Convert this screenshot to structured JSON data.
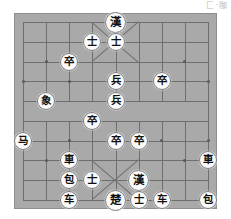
{
  "app": {
    "watermark": "匚·咖"
  },
  "board": {
    "name": "xiangqi-board",
    "columns": 9,
    "rows": 10,
    "board_color": "#a9a9a9",
    "line_color": "#6e6e6e",
    "border_color": "#8e8e8e",
    "piece_face_color": "#fbfbfb",
    "piece_text_color": "#111111",
    "star_points": [
      {
        "col": 1,
        "row": 2
      },
      {
        "col": 7,
        "row": 2
      },
      {
        "col": 0,
        "row": 3
      },
      {
        "col": 2,
        "row": 3
      },
      {
        "col": 4,
        "row": 3
      },
      {
        "col": 6,
        "row": 3
      },
      {
        "col": 8,
        "row": 3
      },
      {
        "col": 1,
        "row": 7
      },
      {
        "col": 7,
        "row": 7
      },
      {
        "col": 0,
        "row": 6
      },
      {
        "col": 2,
        "row": 6
      },
      {
        "col": 4,
        "row": 6
      },
      {
        "col": 6,
        "row": 6
      },
      {
        "col": 8,
        "row": 6
      }
    ],
    "pieces": [
      {
        "id": "p01",
        "glyph": "漢",
        "name": "general-han-top",
        "col": 4,
        "row": 0,
        "type": "general"
      },
      {
        "id": "p02",
        "glyph": "士",
        "name": "advisor",
        "col": 3,
        "row": 1,
        "type": "advisor"
      },
      {
        "id": "p03",
        "glyph": "士",
        "name": "advisor",
        "col": 4,
        "row": 1,
        "type": "advisor"
      },
      {
        "id": "p04",
        "glyph": "卒",
        "name": "pawn-zu",
        "col": 2,
        "row": 2,
        "type": "pawn"
      },
      {
        "id": "p05",
        "glyph": "兵",
        "name": "soldier-bing",
        "col": 4,
        "row": 3,
        "type": "soldier"
      },
      {
        "id": "p06",
        "glyph": "卒",
        "name": "pawn-zu",
        "col": 6,
        "row": 3,
        "type": "pawn"
      },
      {
        "id": "p07",
        "glyph": "象",
        "name": "elephant-xiang",
        "col": 1,
        "row": 4,
        "type": "elephant"
      },
      {
        "id": "p08",
        "glyph": "兵",
        "name": "soldier-bing",
        "col": 4,
        "row": 4,
        "type": "soldier"
      },
      {
        "id": "p09",
        "glyph": "卒",
        "name": "pawn-zu",
        "col": 3,
        "row": 5,
        "type": "pawn"
      },
      {
        "id": "p10",
        "glyph": "马",
        "name": "horse-ma",
        "col": 0,
        "row": 6,
        "type": "horse"
      },
      {
        "id": "p11",
        "glyph": "卒",
        "name": "pawn-zu",
        "col": 4,
        "row": 6,
        "type": "pawn"
      },
      {
        "id": "p12",
        "glyph": "卒",
        "name": "pawn-zu",
        "col": 5,
        "row": 6,
        "type": "pawn"
      },
      {
        "id": "p13",
        "glyph": "車",
        "name": "chariot-ju",
        "col": 2,
        "row": 7,
        "type": "chariot"
      },
      {
        "id": "p14",
        "glyph": "車",
        "name": "chariot-ju",
        "col": 8,
        "row": 7,
        "type": "chariot"
      },
      {
        "id": "p15",
        "glyph": "包",
        "name": "cannon-pao",
        "col": 2,
        "row": 8,
        "type": "cannon"
      },
      {
        "id": "p16",
        "glyph": "士",
        "name": "advisor",
        "col": 3,
        "row": 8,
        "type": "advisor"
      },
      {
        "id": "p17",
        "glyph": "漢",
        "name": "general-han-bottom",
        "col": 5,
        "row": 8,
        "type": "general"
      },
      {
        "id": "p18",
        "glyph": "车",
        "name": "chariot-che",
        "col": 2,
        "row": 9,
        "type": "chariot"
      },
      {
        "id": "p19",
        "glyph": "楚",
        "name": "general-chu",
        "col": 4,
        "row": 9,
        "type": "general"
      },
      {
        "id": "p20",
        "glyph": "士",
        "name": "advisor",
        "col": 5,
        "row": 9,
        "type": "advisor"
      },
      {
        "id": "p21",
        "glyph": "车",
        "name": "chariot-che",
        "col": 6,
        "row": 9,
        "type": "chariot"
      },
      {
        "id": "p22",
        "glyph": "包",
        "name": "cannon-pao",
        "col": 8,
        "row": 9,
        "type": "cannon"
      }
    ]
  }
}
